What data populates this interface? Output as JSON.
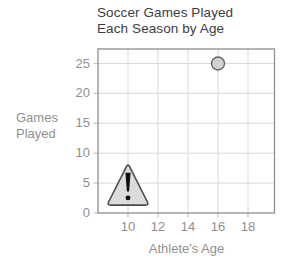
{
  "figure": {
    "title_lines": [
      "Soccer Games Played",
      "Each Season by Age"
    ],
    "y_axis_label_lines": [
      "Games",
      "Played"
    ],
    "x_axis_label": "Athlete's Age"
  },
  "chart_data": {
    "type": "scatter",
    "title": "Soccer Games Played Each Season by Age",
    "xlabel": "Athlete's Age",
    "ylabel": "Games Played",
    "xlim": [
      8,
      20
    ],
    "ylim": [
      0,
      27.5
    ],
    "x_ticks": [
      10,
      12,
      14,
      16,
      18
    ],
    "y_ticks": [
      0,
      5,
      10,
      15,
      20,
      25
    ],
    "grid": true,
    "legend": "none",
    "points": [
      {
        "x": 16,
        "y": 25
      }
    ],
    "annotations": [
      {
        "type": "warning-triangle",
        "glyph": "!",
        "x": 10,
        "y": 5
      }
    ]
  },
  "colors": {
    "background": "#ffffff",
    "title_text": "#3d3d3d",
    "axis_text": "#8f8f8f",
    "grid_line": "#d9d9d9",
    "tick_mark": "#c4c4c4",
    "plot_border": "#8e8e8e",
    "point_fill": "#d2d2d2",
    "point_stroke": "#636363",
    "warning_fill": "#dcdcdc",
    "warning_stroke": "#4c4c4c",
    "warning_glyph": "#0f0f0f"
  }
}
